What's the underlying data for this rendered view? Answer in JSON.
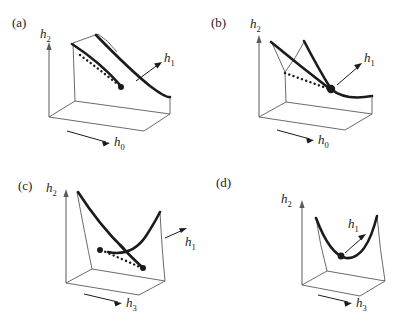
{
  "figure": {
    "type": "diagram",
    "background_color": "#ffffff",
    "ink_color": "#1b1b1b",
    "thin_line_color": "#5a5a5a",
    "panels": [
      {
        "id": "a",
        "label": "(a)",
        "axes": {
          "vertical": {
            "text": "h",
            "sub": "2"
          },
          "horizontal": {
            "text": "h",
            "sub": "0"
          },
          "depth": {
            "text": "h",
            "sub": "1"
          }
        },
        "features": {
          "thick_curves": 2,
          "dotted_curve": 1,
          "endpoint_dots": 1,
          "cusp_tent": true
        }
      },
      {
        "id": "b",
        "label": "(b)",
        "axes": {
          "vertical": {
            "text": "h",
            "sub": "2"
          },
          "horizontal": {
            "text": "h",
            "sub": "0"
          },
          "depth": {
            "text": "h",
            "sub": "1"
          }
        },
        "features": {
          "thick_curves": 2,
          "dotted_curve": 1,
          "endpoint_dots": 1,
          "cusp_tent": true
        }
      },
      {
        "id": "c",
        "label": "(c)",
        "axes": {
          "vertical": {
            "text": "h",
            "sub": "2"
          },
          "horizontal": {
            "text": "h",
            "sub": "3"
          },
          "depth": {
            "text": "h",
            "sub": "1"
          }
        },
        "features": {
          "thick_curves": 2,
          "dotted_curve": 1,
          "endpoint_dots": 2,
          "cusp_tent": false
        }
      },
      {
        "id": "d",
        "label": "(d)",
        "axes": {
          "vertical": {
            "text": "h",
            "sub": "2"
          },
          "horizontal": {
            "text": "h",
            "sub": "3"
          },
          "depth": {
            "text": "h",
            "sub": "1"
          }
        },
        "features": {
          "thick_curves": 1,
          "dotted_curve": 0,
          "endpoint_dots": 1,
          "cusp_tent": false
        }
      }
    ]
  }
}
